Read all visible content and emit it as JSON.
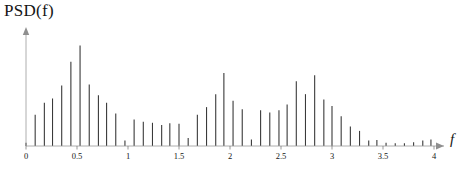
{
  "chart_data": {
    "type": "bar",
    "title": "",
    "ylabel": "PSD(f)",
    "xlabel": "f",
    "grid": false,
    "legend": null,
    "xlim": [
      0,
      4.15
    ],
    "ylim": [
      0,
      1.0
    ],
    "xticks": [
      0,
      0.5,
      1,
      1.5,
      2,
      2.5,
      3,
      3.5,
      4
    ],
    "xticklabels": [
      "0",
      "0.5",
      "1",
      "1.5",
      "2",
      "2.5",
      "3",
      "3.5",
      "4"
    ],
    "yticks": [],
    "yticklabels": [],
    "bar_color": "#3a3a3a",
    "axis_color": "#9a9a9a",
    "x": [
      0.0,
      0.09,
      0.18,
      0.26,
      0.35,
      0.44,
      0.53,
      0.62,
      0.71,
      0.79,
      0.88,
      0.97,
      1.06,
      1.15,
      1.24,
      1.33,
      1.41,
      1.5,
      1.59,
      1.68,
      1.77,
      1.86,
      1.94,
      2.03,
      2.12,
      2.21,
      2.3,
      2.39,
      2.48,
      2.56,
      2.65,
      2.74,
      2.83,
      2.92,
      3.0,
      3.09,
      3.18,
      3.27,
      3.36,
      3.44,
      3.53,
      3.62,
      3.71,
      3.8,
      3.89,
      3.97
    ],
    "values": [
      0.03,
      0.29,
      0.4,
      0.44,
      0.56,
      0.78,
      0.93,
      0.57,
      0.47,
      0.4,
      0.3,
      0.05,
      0.245,
      0.225,
      0.215,
      0.195,
      0.21,
      0.205,
      0.075,
      0.29,
      0.36,
      0.48,
      0.675,
      0.42,
      0.34,
      0.06,
      0.33,
      0.31,
      0.33,
      0.385,
      0.6,
      0.48,
      0.655,
      0.43,
      0.37,
      0.275,
      0.18,
      0.14,
      0.05,
      0.055,
      0.03,
      0.025,
      0.025,
      0.035,
      0.05,
      0.06
    ],
    "peaks": [
      {
        "f": 0.53,
        "psd": 0.93,
        "label": "dominant peak"
      },
      {
        "f": 0.44,
        "psd": 0.78,
        "label": "secondary peak"
      },
      {
        "f": 1.94,
        "psd": 0.675,
        "label": "mid-band peak"
      },
      {
        "f": 2.83,
        "psd": 0.655,
        "label": "upper peak"
      },
      {
        "f": 2.65,
        "psd": 0.6,
        "label": "upper peak 2"
      }
    ]
  },
  "axes": {
    "y_axis_label": "PSD(f)",
    "x_axis_label": "f"
  }
}
